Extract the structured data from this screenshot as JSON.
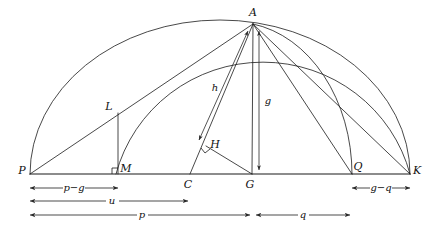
{
  "figure": {
    "kind": "geometric-construction-diagram",
    "background_color": "#ffffff",
    "line_color": "#1a1a1a",
    "dimension_color": "#2a2a2a"
  },
  "points": [
    {
      "id": "P",
      "label": "P",
      "x": 30,
      "y": 174,
      "label_x": 22,
      "label_y": 174
    },
    {
      "id": "L",
      "label": "L",
      "x": 118,
      "y": 113,
      "label_x": 109,
      "label_y": 110
    },
    {
      "id": "M",
      "label": "M",
      "x": 118,
      "y": 174,
      "label_x": 124,
      "label_y": 172
    },
    {
      "id": "C",
      "label": "C",
      "x": 190,
      "y": 174,
      "label_x": 187,
      "label_y": 187
    },
    {
      "id": "H",
      "label": "H",
      "x": 206,
      "y": 146,
      "label_x": 212,
      "label_y": 146
    },
    {
      "id": "G",
      "label": "G",
      "x": 252,
      "y": 174,
      "label_x": 248,
      "label_y": 187
    },
    {
      "id": "A",
      "label": "A",
      "x": 253,
      "y": 24,
      "label_x": 249,
      "label_y": 16
    },
    {
      "id": "Q",
      "label": "Q",
      "x": 352,
      "y": 174,
      "label_x": 354,
      "label_y": 170
    },
    {
      "id": "K",
      "label": "K",
      "x": 410,
      "y": 174,
      "label_x": 415,
      "label_y": 174
    }
  ],
  "measure_labels": {
    "h": "h",
    "g": "g"
  },
  "dimensions": [
    {
      "id": "p-minus-g",
      "label": "p−g",
      "x1": 30,
      "x2": 118,
      "y": 188,
      "label_x": 74,
      "label_y": 188
    },
    {
      "id": "u",
      "label": "u",
      "x1": 30,
      "x2": 188,
      "y": 201,
      "label_x": 112,
      "label_y": 201
    },
    {
      "id": "p",
      "label": "p",
      "x1": 30,
      "x2": 250,
      "y": 215,
      "label_x": 142,
      "label_y": 215
    },
    {
      "id": "q",
      "label": "q",
      "x1": 256,
      "x2": 350,
      "y": 215,
      "label_x": 303,
      "label_y": 215
    },
    {
      "id": "g-minus-q",
      "label": "g−q",
      "x1": 352,
      "x2": 410,
      "y": 188,
      "label_x": 381,
      "label_y": 188
    }
  ],
  "arcs": [
    {
      "id": "outer-arc-P-to-K",
      "from": "P",
      "to": "K",
      "description": "large semicircular arc over the whole baseline"
    },
    {
      "id": "inner-arc-M-to-A-to-K",
      "from": "M",
      "to": "K",
      "description": "arc through A meeting baseline near M"
    },
    {
      "id": "arc-A-to-Q",
      "from": "A",
      "to": "Q",
      "description": "short arc from apex A down to Q"
    }
  ],
  "segments": [
    {
      "id": "baseline-P-K",
      "from": "P",
      "to": "K"
    },
    {
      "id": "line-P-A",
      "from": "P",
      "to": "A"
    },
    {
      "id": "line-L-M",
      "from": "L",
      "to": "M"
    },
    {
      "id": "line-C-A",
      "from": "C",
      "to": "A"
    },
    {
      "id": "line-H-G",
      "from": "H",
      "to": "G"
    },
    {
      "id": "line-G-A",
      "from": "G",
      "to": "A"
    },
    {
      "id": "line-Q-A",
      "from": "Q",
      "to": "A"
    },
    {
      "id": "line-K-A",
      "from": "K",
      "to": "A"
    }
  ]
}
